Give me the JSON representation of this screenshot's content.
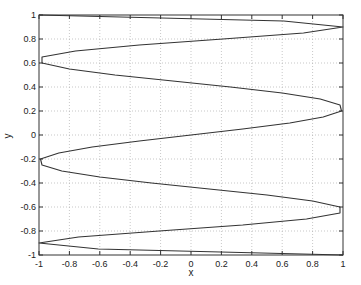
{
  "chart_data": {
    "type": "line",
    "title": "",
    "xlabel": "x",
    "ylabel": "y",
    "xlim": [
      -1,
      1
    ],
    "ylim": [
      -1,
      1
    ],
    "grid": true,
    "legend": null,
    "xticks": [
      -1,
      -0.8,
      -0.6,
      -0.4,
      -0.2,
      0,
      0.2,
      0.4,
      0.6,
      0.8,
      1
    ],
    "yticks": [
      -1,
      -0.8,
      -0.6,
      -0.4,
      -0.2,
      0,
      0.2,
      0.4,
      0.6,
      0.8,
      1
    ],
    "xtick_labels": [
      "-1",
      "-0.8",
      "-0.6",
      "-0.4",
      "-0.2",
      "0",
      "0.2",
      "0.4",
      "0.6",
      "0.8",
      "1"
    ],
    "ytick_labels": [
      "-1",
      "-0.8",
      "-0.6",
      "-0.4",
      "-0.2",
      "0",
      "0.2",
      "0.4",
      "0.6",
      "0.8",
      "1"
    ],
    "series": [
      {
        "name": "curve",
        "color": "#333333",
        "x": [
          -1,
          0.61,
          1.0,
          0.74,
          0.21,
          -0.34,
          -0.76,
          -0.98,
          -0.98,
          -0.8,
          -0.5,
          -0.12,
          0.26,
          0.6,
          0.85,
          0.98,
          0.99,
          0.87,
          0.65,
          0.34,
          0,
          -0.34,
          -0.65,
          -0.87,
          -0.99,
          -0.98,
          -0.85,
          -0.6,
          -0.26,
          0.12,
          0.5,
          0.8,
          0.98,
          0.98,
          0.76,
          0.34,
          -0.21,
          -0.74,
          -1.0,
          -0.61,
          1
        ],
        "y": [
          1,
          0.95,
          0.9,
          0.85,
          0.8,
          0.75,
          0.7,
          0.65,
          0.6,
          0.55,
          0.5,
          0.45,
          0.4,
          0.35,
          0.3,
          0.25,
          0.2,
          0.15,
          0.1,
          0.05,
          0,
          -0.05,
          -0.1,
          -0.15,
          -0.2,
          -0.25,
          -0.3,
          -0.35,
          -0.4,
          -0.45,
          -0.5,
          -0.55,
          -0.6,
          -0.65,
          -0.7,
          -0.75,
          -0.8,
          -0.85,
          -0.9,
          -0.95,
          -1
        ]
      }
    ]
  },
  "plot": {
    "axes_px": {
      "left": 39,
      "right": 343,
      "top": 15,
      "bottom": 255
    },
    "colors": {
      "line": "#333333",
      "axes": "#333333",
      "grid": "#b0b0b0",
      "background": "#ffffff"
    }
  }
}
